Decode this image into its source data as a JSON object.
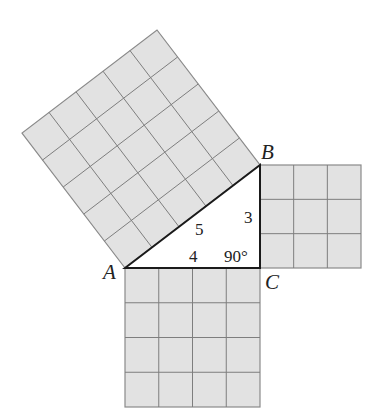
{
  "diagram": {
    "vertices": {
      "A": {
        "label": "A",
        "x": 125,
        "y": 268
      },
      "B": {
        "label": "B",
        "x": 260,
        "y": 165
      },
      "C": {
        "label": "C",
        "x": 260,
        "y": 268
      }
    },
    "sides": {
      "hypotenuse": {
        "label": "5",
        "units": 5
      },
      "vertical": {
        "label": "3",
        "units": 3
      },
      "horizontal": {
        "label": "4",
        "units": 4
      }
    },
    "angle": {
      "label": "90°"
    },
    "colors": {
      "square_fill": "#e2e2e2",
      "grid_line": "#7e7e7e",
      "triangle_stroke": "#1a1a1a"
    }
  }
}
